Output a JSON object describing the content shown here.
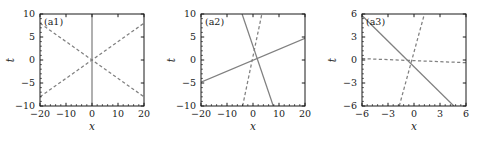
{
  "figure": {
    "background": "#ffffff",
    "line_color": "#808080",
    "axis_color": "#1a1a1a",
    "text_color": "#1a1a1a"
  },
  "chart_data": [
    {
      "type": "line",
      "title": "(a1)",
      "xlabel": "x",
      "ylabel": "t",
      "xlim": [
        -20,
        20
      ],
      "ylim": [
        -10,
        10
      ],
      "xticks": [
        -20,
        -10,
        0,
        10,
        20
      ],
      "xticklabels": [
        "−20",
        "−10",
        "0",
        "10",
        "20"
      ],
      "yticks": [
        -10,
        -5,
        0,
        5,
        10
      ],
      "yticklabels": [
        "−10",
        "−5",
        "0",
        "5",
        "10"
      ],
      "grid": false,
      "legend": "none",
      "series": [
        {
          "name": "vertical-solid",
          "style": "solid",
          "color": "#808080",
          "x": [
            0,
            0
          ],
          "y": [
            -10,
            10
          ]
        },
        {
          "name": "dashed-negative-slope",
          "style": "dashed",
          "color": "#808080",
          "x": [
            -20,
            20
          ],
          "y": [
            8,
            -8
          ]
        },
        {
          "name": "dashed-positive-slope",
          "style": "dashed",
          "color": "#808080",
          "x": [
            -20,
            20
          ],
          "y": [
            -8,
            8
          ]
        }
      ]
    },
    {
      "type": "line",
      "title": "(a2)",
      "xlabel": "x",
      "ylabel": "t",
      "xlim": [
        -20,
        20
      ],
      "ylim": [
        -10,
        10
      ],
      "xticks": [
        -20,
        -10,
        0,
        10,
        20
      ],
      "xticklabels": [
        "−20",
        "−10",
        "0",
        "10",
        "20"
      ],
      "yticks": [
        -10,
        -5,
        0,
        5,
        10
      ],
      "yticklabels": [
        "−10",
        "−5",
        "0",
        "5",
        "10"
      ],
      "grid": false,
      "legend": "none",
      "series": [
        {
          "name": "solid-shallow-positive",
          "style": "solid",
          "color": "#808080",
          "x": [
            -20,
            20
          ],
          "y": [
            -4.8,
            4.7
          ]
        },
        {
          "name": "solid-steep-negative",
          "style": "solid",
          "color": "#808080",
          "x": [
            -4.2,
            7.8
          ],
          "y": [
            10,
            -10
          ]
        },
        {
          "name": "dashed-steep-positive",
          "style": "dashed",
          "color": "#808080",
          "x": [
            -4.0,
            3.4
          ],
          "y": [
            -10,
            10
          ]
        }
      ]
    },
    {
      "type": "line",
      "title": "(a3)",
      "xlabel": "x",
      "ylabel": "t",
      "xlim": [
        -6,
        6
      ],
      "ylim": [
        -6,
        6
      ],
      "xticks": [
        -6,
        -3,
        0,
        3,
        6
      ],
      "xticklabels": [
        "−6",
        "−3",
        "0",
        "3",
        "6"
      ],
      "yticks": [
        -6,
        -3,
        0,
        3,
        6
      ],
      "yticklabels": [
        "−6",
        "−3",
        "0",
        "3",
        "6"
      ],
      "grid": false,
      "legend": "none",
      "series": [
        {
          "name": "solid-negative-slope",
          "style": "solid",
          "color": "#808080",
          "x": [
            -6,
            4.6
          ],
          "y": [
            5.8,
            -6
          ]
        },
        {
          "name": "dashed-steep-positive",
          "style": "dashed",
          "color": "#808080",
          "x": [
            -1.7,
            1.2
          ],
          "y": [
            -6,
            6
          ]
        },
        {
          "name": "dashed-shallow-negative",
          "style": "dashed",
          "color": "#808080",
          "x": [
            -6,
            6
          ],
          "y": [
            0.18,
            -0.35
          ]
        }
      ]
    }
  ]
}
